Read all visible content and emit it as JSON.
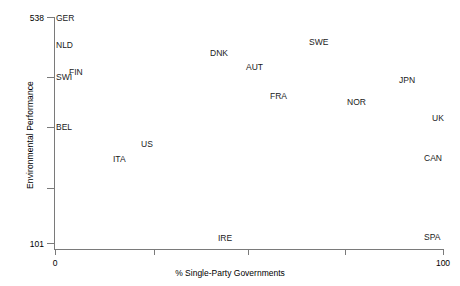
{
  "chart_data": {
    "type": "scatter",
    "title": "",
    "xlabel": "% Single-Party Governments",
    "ylabel": "Environmental Performance",
    "xlim": [
      0,
      100
    ],
    "ylim": [
      101,
      538
    ],
    "grid": false,
    "legend": null,
    "marker_style": "text-label",
    "xtick_labels": [
      "0",
      "100"
    ],
    "ytick_labels": [
      "538",
      "101"
    ],
    "xticks": [
      0,
      25,
      50,
      75,
      100
    ],
    "yticks": [
      538,
      429,
      320,
      211,
      101
    ],
    "points": [
      {
        "label": "GER",
        "x": 0,
        "y": 538,
        "px": 56,
        "py": 13
      },
      {
        "label": "NLD",
        "x": 0,
        "y": 483,
        "px": 56,
        "py": 40
      },
      {
        "label": "SWI",
        "x": 0,
        "y": 427,
        "px": 56,
        "py": 72
      },
      {
        "label": "FIN",
        "x": 3,
        "y": 437,
        "px": 69,
        "py": 67
      },
      {
        "label": "BEL",
        "x": 0,
        "y": 337,
        "px": 56,
        "py": 122
      },
      {
        "label": "ITA",
        "x": 14,
        "y": 286,
        "px": 113,
        "py": 154
      },
      {
        "label": "US",
        "x": 20,
        "y": 302,
        "px": 141,
        "py": 139
      },
      {
        "label": "DNK",
        "x": 40,
        "y": 467,
        "px": 210,
        "py": 48
      },
      {
        "label": "AUT",
        "x": 47,
        "y": 452,
        "px": 246,
        "py": 62
      },
      {
        "label": "FRA",
        "x": 53,
        "y": 414,
        "px": 270,
        "py": 91
      },
      {
        "label": "IRE",
        "x": 48,
        "y": 110,
        "px": 218,
        "py": 233
      },
      {
        "label": "SWE",
        "x": 64,
        "y": 495,
        "px": 309,
        "py": 37
      },
      {
        "label": "NOR",
        "x": 74,
        "y": 404,
        "px": 347,
        "py": 97
      },
      {
        "label": "JPN",
        "x": 87,
        "y": 440,
        "px": 399,
        "py": 75
      },
      {
        "label": "UK",
        "x": 95,
        "y": 362,
        "px": 432,
        "py": 113
      },
      {
        "label": "CAN",
        "x": 93,
        "y": 310,
        "px": 424,
        "py": 153
      },
      {
        "label": "SPA",
        "x": 97,
        "y": 105,
        "px": 424,
        "py": 232
      }
    ]
  },
  "axes": {
    "y_title": "Environmental Performance",
    "x_title": "% Single-Party Governments",
    "y_tick_labels": [
      {
        "text": "538",
        "py": 13
      },
      {
        "text": "",
        "py": 72
      },
      {
        "text": "",
        "py": 123
      },
      {
        "text": "",
        "py": 184
      },
      {
        "text": "101",
        "py": 239
      }
    ],
    "y_tick_positions": [
      17,
      77,
      127,
      188,
      243
    ],
    "x_tick_positions": [
      55,
      154,
      248,
      345,
      443
    ],
    "x_tick_labels": [
      {
        "text": "0",
        "px": 55
      },
      {
        "text": "",
        "px": 154
      },
      {
        "text": "",
        "px": 248
      },
      {
        "text": "",
        "px": 345
      },
      {
        "text": "100",
        "px": 443
      }
    ]
  },
  "colors": {
    "background": "#ffffff",
    "axis": "#7a7a7a",
    "text": "#000000",
    "point_label": "#1a1a1a"
  }
}
